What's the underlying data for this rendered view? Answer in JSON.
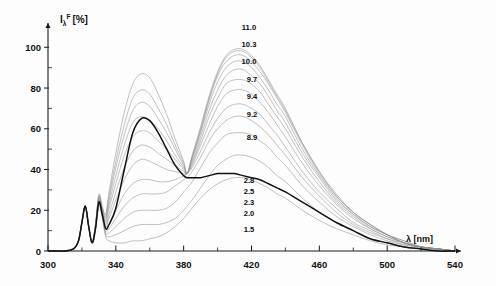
{
  "figure": {
    "background_color": "#fdfdfd",
    "ink_color": "#111111",
    "faint_curve_color": "#8e8e8e",
    "bold_curve_color": "#111111"
  },
  "axes": {
    "x": {
      "label_symbol": "λ",
      "label_unit": "[nm]",
      "label_full": "λ [nm]",
      "min": 300,
      "max": 540,
      "major_ticks": [
        300,
        340,
        380,
        420,
        460,
        500,
        540
      ],
      "major_tick_labels": [
        "300",
        "340",
        "380",
        "420",
        "460",
        "500",
        "540"
      ],
      "minor_tick_step": 20
    },
    "y": {
      "label_symbol": "I",
      "label_subscript": "λ",
      "label_superscript": "F",
      "label_unit": "[%]",
      "label_full": "Iλ F [%]",
      "min": 0,
      "max": 108,
      "major_ticks": [
        0,
        20,
        40,
        60,
        80,
        100
      ],
      "major_tick_labels": [
        "0",
        "20",
        "40",
        "60",
        "80",
        "100"
      ],
      "minor_tick_step": 10
    }
  },
  "series_labels": [
    {
      "text": "11.0",
      "x_px": 249,
      "y_px": 30
    },
    {
      "text": "10.3",
      "x_px": 249,
      "y_px": 47
    },
    {
      "text": "10.0",
      "x_px": 249,
      "y_px": 64
    },
    {
      "text": "9.7",
      "x_px": 252,
      "y_px": 82
    },
    {
      "text": "9.4",
      "x_px": 252,
      "y_px": 99
    },
    {
      "text": "9.2",
      "x_px": 252,
      "y_px": 117
    },
    {
      "text": "8.9",
      "x_px": 252,
      "y_px": 140
    },
    {
      "text": "2.8",
      "x_px": 249,
      "y_px": 183
    },
    {
      "text": "2.5",
      "x_px": 249,
      "y_px": 194
    },
    {
      "text": "2.3",
      "x_px": 249,
      "y_px": 205
    },
    {
      "text": "2.0",
      "x_px": 249,
      "y_px": 216
    },
    {
      "text": "1.5",
      "x_px": 249,
      "y_px": 232
    }
  ],
  "chart_data": {
    "type": "line",
    "title": "",
    "subtitle": "",
    "xlabel": "λ [nm]",
    "ylabel": "Iλ F [%]",
    "xlim": [
      300,
      540
    ],
    "ylim": [
      0,
      108
    ],
    "grid": false,
    "legend_position": "inline-right-of-curves",
    "legend_title": "pH",
    "annotations": [
      {
        "text": "isosbestic point",
        "x": 382,
        "y": 36
      }
    ],
    "x": [
      300,
      305,
      310,
      315,
      318,
      320,
      322,
      324,
      326,
      328,
      330,
      332,
      334,
      336,
      340,
      345,
      350,
      355,
      360,
      365,
      370,
      375,
      380,
      382,
      385,
      390,
      395,
      400,
      405,
      410,
      415,
      420,
      425,
      430,
      435,
      440,
      450,
      460,
      470,
      480,
      490,
      500,
      510,
      520,
      530,
      540
    ],
    "series": [
      {
        "name": "1.5",
        "emphasis": "faint",
        "values": [
          0,
          0,
          0,
          1,
          5,
          14,
          22,
          12,
          4,
          10,
          22,
          16,
          7,
          5,
          4,
          4,
          5,
          5,
          6,
          7,
          9,
          12,
          16,
          18,
          21,
          26,
          30,
          33,
          35,
          36,
          36,
          35,
          33,
          31,
          28,
          26,
          20,
          15,
          11,
          8,
          5,
          3,
          2,
          1,
          1,
          0
        ]
      },
      {
        "name": "2.0",
        "emphasis": "faint",
        "values": [
          0,
          0,
          0,
          1,
          5,
          14,
          22,
          12,
          4,
          11,
          23,
          17,
          8,
          7,
          8,
          10,
          12,
          13,
          13,
          13,
          14,
          16,
          20,
          22,
          25,
          31,
          37,
          42,
          45,
          47,
          47,
          46,
          44,
          41,
          37,
          34,
          26,
          19,
          14,
          10,
          6,
          4,
          2,
          1,
          1,
          0
        ]
      },
      {
        "name": "2.3",
        "emphasis": "faint",
        "values": [
          0,
          0,
          0,
          1,
          5,
          14,
          22,
          12,
          4,
          11,
          23,
          17,
          9,
          9,
          12,
          16,
          19,
          20,
          20,
          20,
          21,
          24,
          29,
          31,
          34,
          41,
          48,
          53,
          57,
          58,
          58,
          57,
          54,
          51,
          46,
          42,
          32,
          24,
          17,
          12,
          8,
          5,
          3,
          2,
          1,
          0
        ]
      },
      {
        "name": "2.5",
        "emphasis": "faint",
        "values": [
          0,
          0,
          0,
          1,
          5,
          14,
          22,
          12,
          4,
          11,
          23,
          18,
          10,
          11,
          16,
          22,
          26,
          28,
          28,
          28,
          29,
          32,
          35,
          36,
          39,
          46,
          54,
          60,
          64,
          66,
          66,
          64,
          61,
          57,
          52,
          47,
          36,
          27,
          19,
          13,
          9,
          6,
          3,
          2,
          1,
          0
        ]
      },
      {
        "name": "2.8",
        "emphasis": "faint",
        "values": [
          0,
          0,
          0,
          1,
          5,
          14,
          22,
          12,
          4,
          11,
          24,
          18,
          11,
          13,
          20,
          28,
          33,
          35,
          35,
          34,
          34,
          35,
          37,
          38,
          41,
          49,
          58,
          65,
          70,
          72,
          72,
          70,
          67,
          62,
          57,
          51,
          39,
          29,
          21,
          14,
          10,
          6,
          4,
          2,
          1,
          0
        ]
      },
      {
        "name": "8.9",
        "emphasis": "faint",
        "values": [
          0,
          0,
          0,
          1,
          5,
          14,
          22,
          12,
          4,
          12,
          25,
          19,
          12,
          16,
          25,
          35,
          42,
          45,
          44,
          42,
          40,
          39,
          38,
          38,
          42,
          52,
          62,
          71,
          77,
          79,
          79,
          77,
          73,
          68,
          62,
          56,
          43,
          32,
          23,
          16,
          11,
          7,
          4,
          2,
          1,
          0
        ]
      },
      {
        "name": "9.2",
        "emphasis": "faint",
        "values": [
          0,
          0,
          0,
          1,
          5,
          14,
          22,
          12,
          4,
          12,
          25,
          19,
          13,
          18,
          29,
          41,
          49,
          52,
          51,
          48,
          45,
          42,
          39,
          38,
          43,
          54,
          66,
          75,
          82,
          84,
          84,
          82,
          78,
          72,
          66,
          60,
          46,
          34,
          24,
          17,
          11,
          7,
          4,
          2,
          1,
          0
        ]
      },
      {
        "name": "9.4",
        "emphasis": "faint",
        "values": [
          0,
          0,
          0,
          1,
          5,
          14,
          22,
          12,
          4,
          12,
          26,
          20,
          14,
          21,
          33,
          47,
          56,
          59,
          58,
          54,
          50,
          45,
          40,
          38,
          44,
          56,
          69,
          79,
          86,
          89,
          89,
          86,
          82,
          76,
          69,
          63,
          48,
          36,
          25,
          18,
          12,
          8,
          4,
          2,
          1,
          0
        ]
      },
      {
        "name": "9.7",
        "emphasis": "faint",
        "values": [
          0,
          0,
          0,
          1,
          5,
          14,
          22,
          12,
          4,
          12,
          26,
          20,
          15,
          23,
          37,
          52,
          63,
          66,
          64,
          60,
          54,
          47,
          41,
          38,
          45,
          58,
          72,
          83,
          90,
          93,
          93,
          90,
          85,
          79,
          72,
          66,
          50,
          37,
          26,
          18,
          12,
          8,
          4,
          2,
          1,
          0
        ]
      },
      {
        "name": "10.0",
        "emphasis": "faint",
        "values": [
          0,
          0,
          0,
          1,
          5,
          14,
          22,
          12,
          4,
          13,
          27,
          21,
          16,
          25,
          41,
          57,
          69,
          73,
          71,
          65,
          58,
          50,
          42,
          38,
          46,
          59,
          74,
          86,
          93,
          96,
          96,
          93,
          88,
          82,
          75,
          68,
          52,
          38,
          27,
          19,
          13,
          8,
          4,
          2,
          1,
          0
        ]
      },
      {
        "name": "10.3",
        "emphasis": "faint",
        "values": [
          0,
          0,
          0,
          1,
          5,
          14,
          22,
          12,
          4,
          13,
          27,
          21,
          17,
          27,
          44,
          62,
          75,
          79,
          77,
          70,
          62,
          52,
          43,
          38,
          46,
          60,
          75,
          87,
          95,
          98,
          98,
          95,
          90,
          83,
          76,
          69,
          53,
          39,
          27,
          19,
          13,
          8,
          5,
          2,
          1,
          0
        ]
      },
      {
        "name": "11.0",
        "emphasis": "faint",
        "values": [
          0,
          0,
          0,
          1,
          5,
          14,
          22,
          12,
          4,
          13,
          28,
          22,
          18,
          29,
          48,
          68,
          82,
          87,
          85,
          77,
          67,
          55,
          44,
          38,
          47,
          61,
          76,
          88,
          96,
          99,
          99,
          96,
          91,
          84,
          77,
          70,
          53,
          39,
          28,
          19,
          13,
          8,
          5,
          2,
          1,
          0
        ]
      },
      {
        "name": "bold-reference",
        "emphasis": "bold",
        "values": [
          0,
          0,
          0,
          1,
          5,
          14,
          22,
          12,
          4,
          11,
          24,
          18,
          11,
          13,
          21,
          40,
          58,
          65,
          64,
          58,
          50,
          42,
          37,
          36,
          36,
          36,
          37,
          38,
          38,
          38,
          37,
          36,
          35,
          33,
          31,
          29,
          24,
          19,
          14,
          10,
          6,
          4,
          2,
          1,
          0,
          0
        ]
      }
    ]
  }
}
